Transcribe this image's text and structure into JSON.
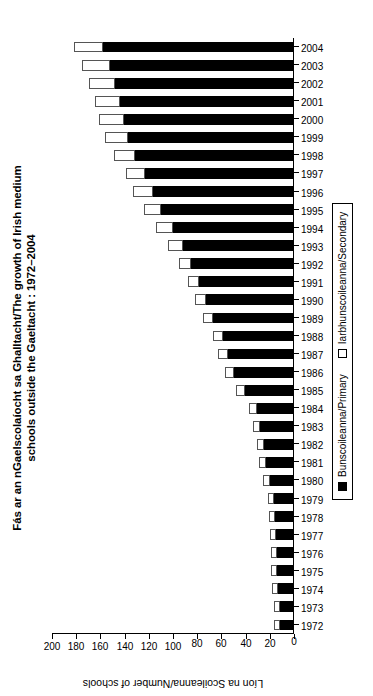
{
  "chart_data": {
    "type": "bar",
    "stacked": true,
    "orientation": "vertical-rotated",
    "title": "Fás ar an nGaelscolaíocht sa Ghalltacht/The growth of Irish medium",
    "subtitle": "schools outside the Gaeltacht : 1972–2004",
    "xlabel": "Bliain/Year",
    "ylabel": "Líon na Scoileanna/Number of schools",
    "ylim": [
      0,
      200
    ],
    "ytick_labels": [
      "0",
      "20",
      "40",
      "60",
      "80",
      "100",
      "120",
      "140",
      "160",
      "180",
      "200"
    ],
    "ytick_values": [
      0,
      20,
      40,
      60,
      80,
      100,
      120,
      140,
      160,
      180,
      200
    ],
    "grid": false,
    "legend_position": "bottom",
    "categories": [
      "1972",
      "1973",
      "1974",
      "1975",
      "1976",
      "1977",
      "1978",
      "1979",
      "1980",
      "1981",
      "1982",
      "1983",
      "1984",
      "1985",
      "1986",
      "1987",
      "1988",
      "1989",
      "1990",
      "1991",
      "1992",
      "1993",
      "1994",
      "1995",
      "1996",
      "1997",
      "1998",
      "1999",
      "2000",
      "2001",
      "2002",
      "2003",
      "2004"
    ],
    "series": [
      {
        "name": "Bunscoileanna/Primary",
        "color": "#000000",
        "values": [
          11,
          11,
          12,
          13,
          13,
          14,
          15,
          16,
          19,
          22,
          24,
          27,
          30,
          40,
          49,
          54,
          58,
          66,
          72,
          78,
          84,
          91,
          99,
          109,
          116,
          122,
          131,
          136,
          140,
          143,
          147,
          151,
          157
        ]
      },
      {
        "name": "Iarbhunscoileanna/Secondary",
        "color": "#ffffff",
        "values": [
          5,
          5,
          5,
          5,
          5,
          5,
          5,
          5,
          6,
          6,
          6,
          6,
          6,
          7,
          7,
          8,
          8,
          8,
          9,
          9,
          10,
          12,
          14,
          14,
          16,
          16,
          17,
          19,
          20,
          21,
          22,
          23,
          24
        ]
      }
    ],
    "totals": [
      16,
      16,
      17,
      18,
      18,
      19,
      20,
      21,
      25,
      28,
      30,
      33,
      36,
      47,
      56,
      62,
      66,
      74,
      81,
      87,
      94,
      103,
      113,
      123,
      132,
      138,
      148,
      155,
      160,
      164,
      169,
      174,
      181
    ]
  },
  "legend": {
    "items": [
      {
        "label": "Bunscoileanna/Primary",
        "swatch": "filled-black-square"
      },
      {
        "label": "Iarbhunscoileanna/Secondary",
        "swatch": "open-white-square"
      }
    ]
  }
}
